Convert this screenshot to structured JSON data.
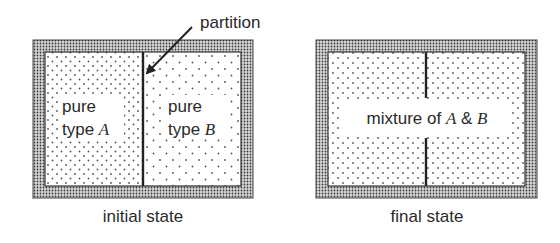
{
  "annotation": {
    "partition_label": "partition"
  },
  "initial": {
    "caption": "initial state",
    "left_line1": "pure",
    "left_line2_prefix": "type ",
    "left_line2_var": "A",
    "right_line1": "pure",
    "right_line2_prefix": "type ",
    "right_line2_var": "B"
  },
  "final": {
    "caption": "final state",
    "label_prefix": "mixture of ",
    "var_a": "A",
    "amp": " & ",
    "var_b": "B"
  },
  "colors": {
    "wall": "#555555",
    "line": "#222222",
    "dot": "#555555",
    "background": "#ffffff"
  }
}
